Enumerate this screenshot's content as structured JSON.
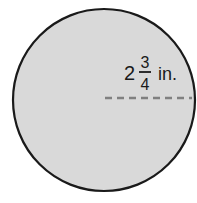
{
  "figure": {
    "shape": "circle",
    "measure": "radius",
    "label": {
      "whole": "2",
      "numerator": "3",
      "denominator": "4",
      "unit": "in."
    },
    "colors": {
      "fill": "#d9d9d9",
      "outline": "#1a1a1a",
      "dashed_line": "#808080"
    }
  }
}
